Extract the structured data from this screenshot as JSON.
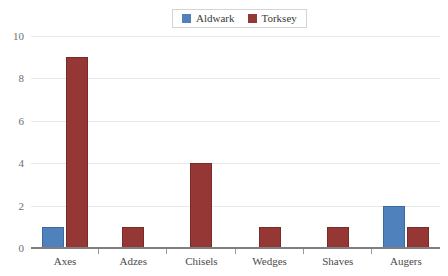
{
  "chart_data": {
    "type": "bar",
    "title": "",
    "xlabel": "",
    "ylabel": "",
    "categories": [
      "Axes",
      "Adzes",
      "Chisels",
      "Wedges",
      "Shaves",
      "Augers"
    ],
    "series": [
      {
        "name": "Aldwark",
        "color": "#4F81BD",
        "values": [
          1,
          0,
          0,
          0,
          0,
          2
        ]
      },
      {
        "name": "Torksey",
        "color": "#953734",
        "values": [
          9,
          1,
          4,
          1,
          1,
          1
        ]
      }
    ],
    "ylim": [
      0,
      10
    ],
    "ytick_step": 2,
    "ytick_labels": [
      "10",
      "8",
      "6",
      "4",
      "2",
      "0"
    ],
    "grid": "horizontal",
    "legend_position": "top-center"
  },
  "legend": {
    "entries": [
      {
        "label": "Aldwark"
      },
      {
        "label": "Torksey"
      }
    ]
  }
}
